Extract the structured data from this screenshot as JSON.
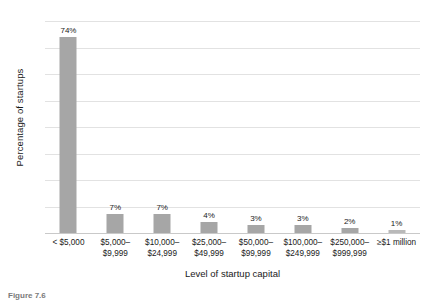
{
  "chart_data": {
    "type": "bar",
    "title": "",
    "xlabel": "Level of startup capital",
    "ylabel": "Percentage of startups",
    "categories": [
      "< $5,000",
      "$5,000–\n$9,999",
      "$10,000–\n$24,999",
      "$25,000–\n$49,999",
      "$50,000–\n$99,999",
      "$100,000–\n$249,999",
      "$250,000–\n$999,999",
      "≥$1 million"
    ],
    "values": [
      74,
      7,
      7,
      4,
      3,
      3,
      2,
      1
    ],
    "data_labels": [
      "74%",
      "7%",
      "7%",
      "4%",
      "3%",
      "3%",
      "2%",
      "1%"
    ],
    "ylim": [
      0,
      80
    ],
    "yticks": [
      0,
      10,
      20,
      30,
      40,
      50,
      60,
      70,
      80
    ],
    "ytick_labels": [
      "0%",
      "10%",
      "20%",
      "30%",
      "40%",
      "50%",
      "60%",
      "70%",
      "80%"
    ],
    "grid": true,
    "legend": false,
    "bar_color": "#a6a6a6",
    "gridline_color": "#e2e2e2"
  },
  "caption": {
    "text": "Figure 7.6"
  }
}
